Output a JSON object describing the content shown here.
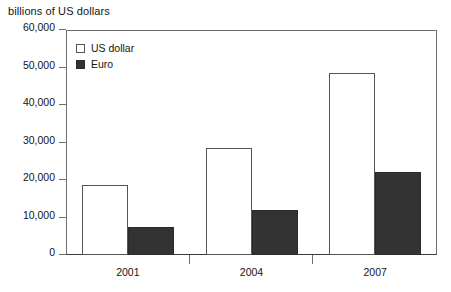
{
  "chart_data": {
    "type": "bar",
    "title": "billions of US dollars",
    "xlabel": "",
    "ylabel": "billions of US dollars",
    "categories": [
      "2001",
      "2004",
      "2007"
    ],
    "series": [
      {
        "name": "US dollar",
        "values": [
          18700,
          28600,
          48500
        ],
        "color": "#ffffff"
      },
      {
        "name": "Euro",
        "values": [
          7600,
          12000,
          22200
        ],
        "color": "#333333"
      }
    ],
    "ylim": [
      0,
      60000
    ],
    "ytick_labels": [
      "0",
      "10,000",
      "20,000",
      "30,000",
      "40,000",
      "50,000",
      "60,000"
    ],
    "ytick_values": [
      0,
      10000,
      20000,
      30000,
      40000,
      50000,
      60000
    ],
    "grid": false,
    "legend_position": "top-left-inside"
  },
  "legend": {
    "entries": [
      {
        "label": "US dollar"
      },
      {
        "label": "Euro"
      }
    ]
  }
}
